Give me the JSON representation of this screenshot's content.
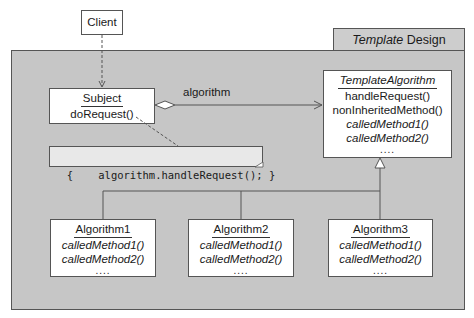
{
  "frame": {
    "title_italic": "Template",
    "title_rest": " Design Pattern",
    "background": "#c6c6c6"
  },
  "client": {
    "name": "Client"
  },
  "subject": {
    "name": "Subject",
    "methods": [
      "doRequest()"
    ]
  },
  "association": {
    "label": "algorithm"
  },
  "note": {
    "text": "{    algorithm.handleRequest(); }"
  },
  "template_algorithm": {
    "name": "TemplateAlgorithm",
    "methods": [
      "handleRequest()",
      "nonInheritedMethod()"
    ],
    "abstract_methods": [
      "calledMethod1()",
      "calledMethod2()"
    ],
    "ellipsis": "...."
  },
  "subclasses": [
    {
      "name": "Algorithm1",
      "methods": [
        "calledMethod1()",
        "calledMethod2()"
      ],
      "ellipsis": "...."
    },
    {
      "name": "Algorithm2",
      "methods": [
        "calledMethod1()",
        "calledMethod2()"
      ],
      "ellipsis": "...."
    },
    {
      "name": "Algorithm3",
      "methods": [
        "calledMethod1()",
        "calledMethod2()"
      ],
      "ellipsis": "...."
    }
  ]
}
